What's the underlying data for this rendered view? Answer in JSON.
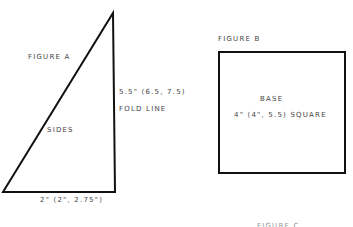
{
  "figure_a": {
    "title": "FIGURE A",
    "height_label": "5.5\" (6.5, 7.5)",
    "fold_label": "FOLD LINE",
    "center_label": "SIDES",
    "base_label": "2\" (2\", 2.75\")"
  },
  "figure_b": {
    "title": "FIGURE B",
    "center_label": "BASE",
    "size_label": "4\" (4\", 5.5) SQUARE"
  },
  "figure_c": {
    "title": "FIGURE C"
  },
  "colors": {
    "stroke": "#111111",
    "text": "#444444"
  }
}
